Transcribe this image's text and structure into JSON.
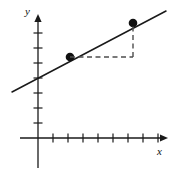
{
  "figure": {
    "title": "",
    "background_color": "#ffffff",
    "stroke_color": "#1a1a1a",
    "point_color": "#111111",
    "dashed_color": "#4d4d4d"
  },
  "axes": {
    "x_label": "x",
    "y_label": "y",
    "origin_px": [
      38,
      138
    ],
    "tick_spacing_px": 15,
    "x_axis": {
      "start_px": [
        20,
        138
      ],
      "end_px": [
        168,
        138
      ],
      "arrow": "right",
      "tick_count_positive": 8,
      "tick_length_px": 9
    },
    "y_axis": {
      "start_px": [
        38,
        168
      ],
      "end_px": [
        38,
        14
      ],
      "arrow": "up",
      "tick_count_positive": 7,
      "tick_length_px": 9
    }
  },
  "chart_data": {
    "type": "line",
    "title": "",
    "xlabel": "x",
    "ylabel": "y",
    "grid": false,
    "legend": null,
    "axis_units": "unlabeled tick marks, spacing = 1 unit",
    "xlim": [
      -1.2,
      8.7
    ],
    "ylim": [
      -2.0,
      8.3
    ],
    "series": [
      {
        "name": "line",
        "kind": "line",
        "style": "solid",
        "x": [
          -1.2,
          8.5
        ],
        "y": [
          3.05,
          8.45
        ],
        "points_px": [
          [
            12,
            92
          ],
          [
            166,
            11
          ]
        ],
        "y_intercept": 4.0,
        "slope": 0.5333
      },
      {
        "name": "marked-points",
        "kind": "scatter",
        "marker": "filled-circle",
        "x": [
          2,
          6.3
        ],
        "y": [
          5.4,
          7.65
        ],
        "points_px": [
          [
            70,
            57
          ],
          [
            133,
            23
          ]
        ]
      },
      {
        "name": "run-segment",
        "kind": "annotation",
        "style": "dashed",
        "orientation": "horizontal",
        "from_px": [
          70,
          57
        ],
        "to_px": [
          133,
          57
        ]
      },
      {
        "name": "rise-segment",
        "kind": "annotation",
        "style": "dashed",
        "orientation": "vertical",
        "from_px": [
          133,
          57
        ],
        "to_px": [
          133,
          23
        ]
      }
    ]
  }
}
